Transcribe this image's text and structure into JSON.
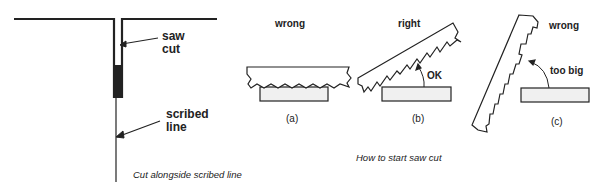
{
  "left_figure": {
    "labels": {
      "saw_cut_1": "saw",
      "saw_cut_2": "cut",
      "scribed_1": "scribed",
      "scribed_2": "line"
    },
    "caption": "Cut alongside scribed line"
  },
  "right_figure": {
    "panels": [
      {
        "id": "a",
        "title": "wrong",
        "label": "(a)"
      },
      {
        "id": "b",
        "title": "right",
        "label": "(b)",
        "angle_note": "OK"
      },
      {
        "id": "c",
        "title": "wrong",
        "label": "(c)",
        "angle_note": "too big"
      }
    ],
    "caption": "How to start saw cut"
  }
}
